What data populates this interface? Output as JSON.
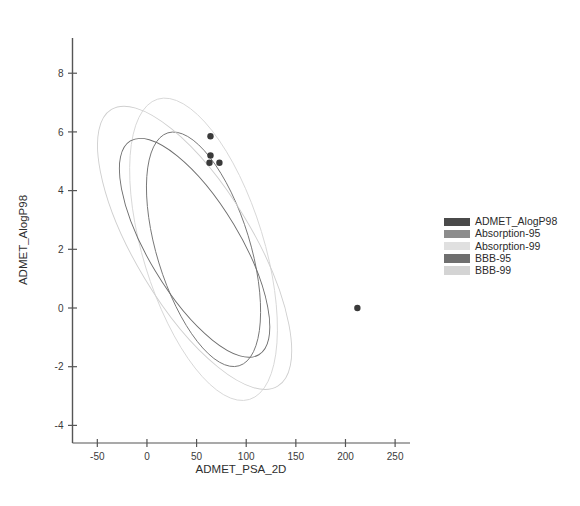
{
  "chart_data": {
    "type": "scatter",
    "title": "",
    "xlabel": "ADMET_PSA_2D",
    "ylabel": "ADMET_AlogP98",
    "xlim": [
      -75,
      265
    ],
    "ylim": [
      -4.6,
      9.2
    ],
    "xticks": [
      -50,
      0,
      50,
      100,
      150,
      200,
      250
    ],
    "yticks": [
      -4,
      -2,
      0,
      2,
      4,
      6,
      8
    ],
    "grid": false,
    "legend_position": "right",
    "points": [
      {
        "x": 64,
        "y": 5.85
      },
      {
        "x": 64,
        "y": 5.2
      },
      {
        "x": 63,
        "y": 4.95
      },
      {
        "x": 73,
        "y": 4.95
      },
      {
        "x": 212,
        "y": 0.0
      }
    ],
    "series": [
      {
        "name": "ADMET_AlogP98",
        "type": "points",
        "color": "#3a3a3a"
      },
      {
        "name": "Absorption-95",
        "type": "ellipse",
        "color": "#777777",
        "cx": 57,
        "cy": 2.0,
        "rx": 47,
        "ry": 4.15,
        "angle": -17
      },
      {
        "name": "Absorption-99",
        "type": "ellipse",
        "color": "#d8d8d8",
        "cx": 57,
        "cy": 2.0,
        "rx": 61,
        "ry": 5.35,
        "angle": -17
      },
      {
        "name": "BBB-95",
        "type": "ellipse",
        "color": "#6d6d6d",
        "cx": 48,
        "cy": 2.05,
        "rx": 46,
        "ry": 4.25,
        "angle": -31
      },
      {
        "name": "BBB-99",
        "type": "ellipse",
        "color": "#cfcfcf",
        "cx": 48,
        "cy": 2.05,
        "rx": 59,
        "ry": 5.5,
        "angle": -31
      }
    ]
  },
  "legend": {
    "items": [
      {
        "label": "ADMET_AlogP98",
        "color": "#4a4a4a"
      },
      {
        "label": "Absorption-95",
        "color": "#8c8c8c"
      },
      {
        "label": "Absorption-99",
        "color": "#e0e0e0"
      },
      {
        "label": "BBB-95",
        "color": "#6f6f6f"
      },
      {
        "label": "BBB-99",
        "color": "#d4d4d4"
      }
    ]
  },
  "axes": {
    "x_title": "ADMET_PSA_2D",
    "y_title": "ADMET_AlogP98",
    "x_tick_labels": [
      "-50",
      "0",
      "50",
      "100",
      "150",
      "200",
      "250"
    ],
    "y_tick_labels": [
      "-4",
      "-2",
      "0",
      "2",
      "4",
      "6",
      "8"
    ],
    "axis_color": "#555555"
  }
}
